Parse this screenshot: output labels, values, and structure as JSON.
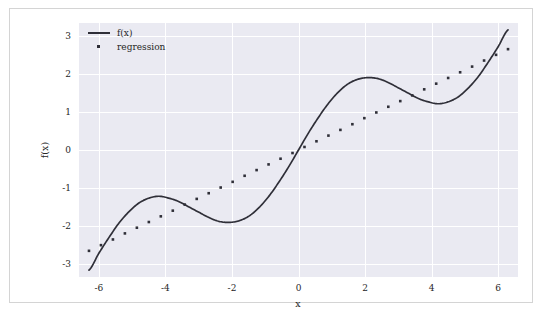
{
  "chart_data": {
    "type": "line",
    "title": "",
    "xlabel": "x",
    "ylabel": "f(x)",
    "xlim": [
      -6.6,
      6.6
    ],
    "ylim": [
      -3.35,
      3.35
    ],
    "xticks": [
      "-6",
      "-4",
      "-2",
      "0",
      "2",
      "4",
      "6"
    ],
    "xtick_values": [
      -6,
      -4,
      -2,
      0,
      2,
      4,
      6
    ],
    "yticks": [
      "3",
      "2",
      "1",
      "0",
      "-1",
      "-2",
      "-3"
    ],
    "ytick_values": [
      3,
      2,
      1,
      0,
      -1,
      -2,
      -3
    ],
    "grid": true,
    "legend_position": "upper left",
    "series": [
      {
        "name": "f(x)",
        "style": "solid-line",
        "color": "#2f2f38",
        "x": [
          -6.3,
          -6.0,
          -5.7,
          -5.4,
          -5.1,
          -4.8,
          -4.5,
          -4.2,
          -3.9,
          -3.6,
          -3.3,
          -3.0,
          -2.7,
          -2.4,
          -2.1,
          -1.8,
          -1.5,
          -1.2,
          -0.9,
          -0.6,
          -0.3,
          0.0,
          0.3,
          0.6,
          0.9,
          1.2,
          1.5,
          1.8,
          2.1,
          2.4,
          2.7,
          3.0,
          3.3,
          3.6,
          3.9,
          4.2,
          4.5,
          4.8,
          5.1,
          5.4,
          5.7,
          6.0,
          6.3
        ],
        "y": [
          -3.17,
          -2.72,
          -2.31,
          -1.93,
          -1.63,
          -1.4,
          -1.27,
          -1.22,
          -1.27,
          -1.36,
          -1.5,
          -1.64,
          -1.78,
          -1.88,
          -1.91,
          -1.87,
          -1.75,
          -1.53,
          -1.23,
          -0.86,
          -0.45,
          0.0,
          0.45,
          0.86,
          1.23,
          1.53,
          1.75,
          1.87,
          1.91,
          1.88,
          1.78,
          1.64,
          1.5,
          1.36,
          1.27,
          1.22,
          1.27,
          1.4,
          1.63,
          1.93,
          2.31,
          2.72,
          3.17
        ],
        "formula": "x/2 + sin(x)"
      },
      {
        "name": "regression",
        "style": "dotted-markers",
        "color": "#2f2f38",
        "x": [
          -6.3,
          -5.94,
          -5.58,
          -5.22,
          -4.86,
          -4.5,
          -4.14,
          -3.78,
          -3.42,
          -3.06,
          -2.7,
          -2.34,
          -1.98,
          -1.62,
          -1.26,
          -0.9,
          -0.54,
          -0.18,
          0.18,
          0.54,
          0.9,
          1.26,
          1.62,
          1.98,
          2.34,
          2.7,
          3.06,
          3.42,
          3.78,
          4.14,
          4.5,
          4.86,
          5.22,
          5.58,
          5.94,
          6.3
        ],
        "y": [
          -2.66,
          -2.51,
          -2.36,
          -2.2,
          -2.05,
          -1.9,
          -1.75,
          -1.6,
          -1.44,
          -1.29,
          -1.14,
          -0.99,
          -0.84,
          -0.68,
          -0.53,
          -0.38,
          -0.23,
          -0.08,
          0.08,
          0.23,
          0.38,
          0.53,
          0.68,
          0.84,
          0.99,
          1.14,
          1.29,
          1.44,
          1.6,
          1.75,
          1.9,
          2.05,
          2.2,
          2.36,
          2.51,
          2.66
        ],
        "slope": 0.4222,
        "intercept": 0.0
      }
    ],
    "legend": [
      {
        "label": "f(x)",
        "marker": "line"
      },
      {
        "label": "regression",
        "marker": "dot"
      }
    ]
  },
  "style": {
    "plot_background": "#eaeaf2",
    "grid_color": "#ffffff",
    "line_color": "#2f2f38",
    "text_color": "#262626",
    "canvas_background": "#ffffff",
    "frame_border": "#d4d4d4"
  }
}
